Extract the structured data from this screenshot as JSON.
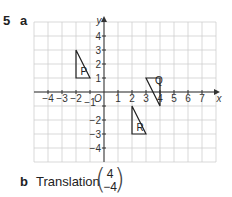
{
  "question": {
    "number": "5",
    "part_a": "a",
    "part_b": "b"
  },
  "answer_b": {
    "text": "Translation",
    "vector": {
      "top": "4",
      "bottom": "−4"
    }
  },
  "chart_data": {
    "type": "diagram",
    "title": "",
    "xlabel": "x",
    "ylabel": "y",
    "xlim": [
      -5,
      8
    ],
    "ylim": [
      -5,
      5
    ],
    "grid": true,
    "origin_label": "O",
    "x_ticks": [
      "−4",
      "−3",
      "−2",
      "−1",
      "1",
      "2",
      "3",
      "4",
      "5",
      "6",
      "7"
    ],
    "y_ticks": [
      "4",
      "3",
      "2",
      "1",
      "−1",
      "−2",
      "−3",
      "−4"
    ],
    "shapes": [
      {
        "label": "P",
        "vertices": [
          [
            -2,
            1
          ],
          [
            -2,
            3
          ],
          [
            -1,
            1
          ]
        ]
      },
      {
        "label": "Q",
        "vertices": [
          [
            3,
            1
          ],
          [
            4,
            1
          ],
          [
            4,
            -1
          ]
        ]
      },
      {
        "label": "R",
        "vertices": [
          [
            2,
            -1
          ],
          [
            2,
            -3
          ],
          [
            3,
            -3
          ]
        ]
      }
    ]
  }
}
